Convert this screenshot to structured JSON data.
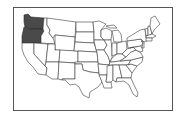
{
  "map": {
    "type": "us-states-outline",
    "highlighted_states": [
      "Washington",
      "Oregon"
    ],
    "highlight_color": "#4a4a4a",
    "state_fill": "#ffffff",
    "stroke_color": "#3a3a3a",
    "frame_color": "#555555"
  }
}
